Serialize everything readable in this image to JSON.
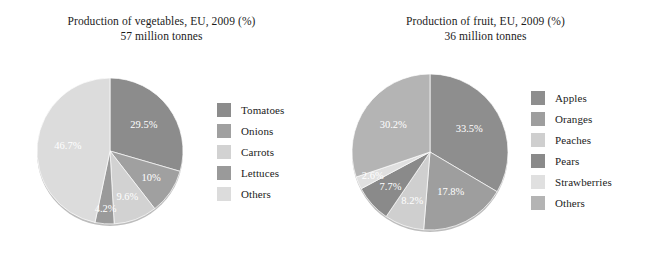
{
  "background_color": "#ffffff",
  "charts": [
    {
      "id": "vegetables",
      "title_line1": "Production of vegetables, EU, 2009 (%)",
      "title_line2": "57 million tonnes",
      "chart_data": {
        "type": "pie",
        "title": "Production of vegetables, EU, 2009 (%)",
        "subtitle": "57 million tonnes",
        "unit": "%",
        "total_label": "57 million tonnes",
        "legend_position": "right",
        "start_angle_deg": 0,
        "direction": "clockwise",
        "categories": [
          "Tomatoes",
          "Onions",
          "Carrots",
          "Lettuces",
          "Others"
        ],
        "values": [
          29.5,
          10,
          9.6,
          4.2,
          46.7
        ],
        "data_labels": [
          "29.5%",
          "10%",
          "9.6%",
          "4.2%",
          "46.7%"
        ],
        "colors": [
          "#8c8c8c",
          "#a0a0a0",
          "#d2d2d2",
          "#9a9a9a",
          "#dcdcdc"
        ]
      },
      "legend": [
        {
          "label": "Tomatoes",
          "color": "#8c8c8c"
        },
        {
          "label": "Onions",
          "color": "#a0a0a0"
        },
        {
          "label": "Carrots",
          "color": "#d2d2d2"
        },
        {
          "label": "Lettuces",
          "color": "#9a9a9a"
        },
        {
          "label": "Others",
          "color": "#dcdcdc"
        }
      ]
    },
    {
      "id": "fruit",
      "title_line1": "Production of fruit, EU, 2009 (%)",
      "title_line2": "36 million tonnes",
      "chart_data": {
        "type": "pie",
        "title": "Production of fruit, EU, 2009 (%)",
        "subtitle": "36 million tonnes",
        "unit": "%",
        "total_label": "36 million tonnes",
        "legend_position": "right",
        "start_angle_deg": 0,
        "direction": "clockwise",
        "categories": [
          "Apples",
          "Oranges",
          "Peaches",
          "Pears",
          "Strawberries",
          "Others"
        ],
        "values": [
          33.5,
          17.8,
          8.2,
          7.7,
          2.6,
          30.2
        ],
        "data_labels": [
          "33.5%",
          "17.8%",
          "8.2%",
          "7.7%",
          "2.6%",
          "30.2%"
        ],
        "colors": [
          "#8e8e8e",
          "#9e9e9e",
          "#cfcfcf",
          "#8a8a8a",
          "#e0e0e0",
          "#b4b4b4"
        ]
      },
      "legend": [
        {
          "label": "Apples",
          "color": "#8e8e8e"
        },
        {
          "label": "Oranges",
          "color": "#9e9e9e"
        },
        {
          "label": "Peaches",
          "color": "#cfcfcf"
        },
        {
          "label": "Pears",
          "color": "#8a8a8a"
        },
        {
          "label": "Strawberries",
          "color": "#e0e0e0"
        },
        {
          "label": "Others",
          "color": "#b4b4b4"
        }
      ]
    }
  ]
}
